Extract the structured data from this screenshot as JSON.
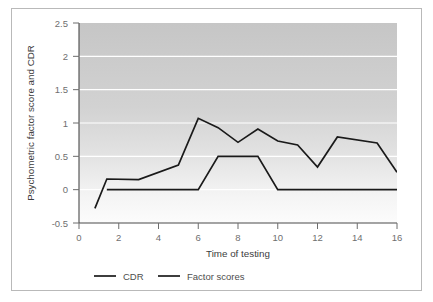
{
  "chart_data": {
    "type": "line",
    "title": "",
    "xlabel": "Time of testing",
    "ylabel": "Psychometric factor score and CDR",
    "xlim": [
      0,
      16
    ],
    "ylim": [
      -0.5,
      2.5
    ],
    "xticks": [
      0,
      2,
      4,
      6,
      8,
      10,
      12,
      14,
      16
    ],
    "xticklabels": [
      "0",
      "2",
      "4",
      "6",
      "8",
      "10",
      "12",
      "14",
      "16"
    ],
    "yticks": [
      -0.5,
      0,
      0.5,
      1,
      1.5,
      2,
      2.5
    ],
    "yticklabels": [
      "-0.5",
      "0",
      "0.5",
      "1",
      "1.5",
      "2",
      "2.5"
    ],
    "grid": "horizontal-white",
    "legend_position": "below-axes",
    "plot_background": "vertical-gray-gradient",
    "series": [
      {
        "name": "CDR",
        "color": "#1a1a1a",
        "x": [
          1.4,
          6,
          7,
          9,
          10,
          16
        ],
        "values": [
          0,
          0,
          0.5,
          0.5,
          0,
          0
        ]
      },
      {
        "name": "Factor scores",
        "color": "#1a1a1a",
        "x": [
          0.8,
          1.4,
          3,
          5,
          6,
          7,
          8,
          9,
          10,
          11,
          12,
          13,
          15,
          16
        ],
        "values": [
          -0.28,
          0.16,
          0.15,
          0.37,
          1.07,
          0.93,
          0.71,
          0.91,
          0.73,
          0.67,
          0.34,
          0.79,
          0.7,
          0.26
        ]
      }
    ]
  },
  "legend": {
    "entries": [
      {
        "label": "CDR"
      },
      {
        "label": "Factor scores"
      }
    ]
  }
}
